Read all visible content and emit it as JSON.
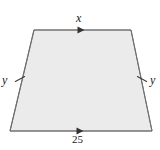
{
  "figure": {
    "kind": "isosceles-trapezoid-diagram",
    "colors": {
      "fill": "#ebebeb",
      "stroke": "#7a7a7a",
      "mark_stroke": "#4d4d4d",
      "text": "#1a1a1a",
      "background": "#ffffff"
    },
    "shape": {
      "name": "trapezoid",
      "vertices": [
        {
          "name": "top-left",
          "x": 34,
          "y": 30
        },
        {
          "name": "top-right",
          "x": 131,
          "y": 30
        },
        {
          "name": "bottom-right",
          "x": 152,
          "y": 131
        },
        {
          "name": "bottom-left",
          "x": 10,
          "y": 131
        }
      ]
    },
    "labels": {
      "top_side": "x",
      "left_side": "y",
      "right_side": "y",
      "bottom_side": "25"
    },
    "marks": {
      "top_arrow": {
        "name": "single-arrowhead",
        "x": 82,
        "y": 30
      },
      "bottom_arrow": {
        "name": "single-arrowhead",
        "x": 81,
        "y": 131
      },
      "left_tick": {
        "name": "single-tick",
        "x": 20,
        "y": 79
      },
      "right_tick": {
        "name": "single-tick",
        "x": 142,
        "y": 79
      }
    }
  }
}
